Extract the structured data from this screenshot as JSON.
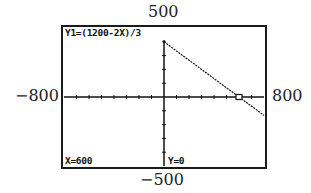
{
  "window_labels": {
    "ymax": "500",
    "ymin": "−500",
    "xmin": "−800",
    "xmax": "800"
  },
  "screen": {
    "function_label": "Y1=(1200-2X)/3",
    "x_readout": "X=600",
    "y_readout": "Y=0"
  },
  "chart_data": {
    "type": "line",
    "title": "Y1=(1200-2X)/3",
    "xlabel": "",
    "ylabel": "",
    "xlim": [
      -800,
      800
    ],
    "ylim": [
      -500,
      500
    ],
    "x_tick_interval": 100,
    "y_tick_interval": 100,
    "grid": false,
    "series": [
      {
        "name": "Y1",
        "expression": "(1200-2X)/3",
        "domain": [
          0,
          800
        ],
        "x": [
          0,
          600,
          800
        ],
        "y": [
          400,
          0,
          -133.3
        ]
      }
    ],
    "trace_cursor": {
      "x": 600,
      "y": 0
    }
  }
}
